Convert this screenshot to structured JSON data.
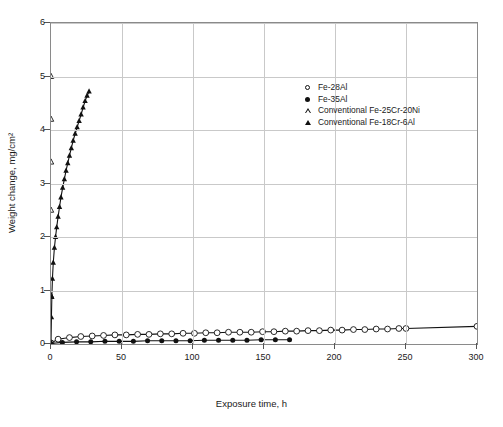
{
  "chart_data": {
    "type": "scatter",
    "title": "",
    "xlabel": "Exposure time, h",
    "ylabel": "Weight change, mg/cm²",
    "xlim": [
      0,
      300
    ],
    "ylim": [
      0,
      6
    ],
    "xticks": [
      0,
      50,
      100,
      150,
      200,
      250,
      300
    ],
    "yticks": [
      0,
      1,
      2,
      3,
      4,
      5,
      6
    ],
    "grid": true,
    "legend_position": "upper-center-right",
    "series": [
      {
        "name": "Fe-28Al",
        "marker": "circle-open",
        "line": true,
        "x": [
          0,
          5,
          13,
          21,
          29,
          37,
          45,
          53,
          61,
          69,
          77,
          85,
          93,
          101,
          109,
          117,
          125,
          133,
          141,
          149,
          157,
          165,
          173,
          181,
          189,
          197,
          205,
          213,
          221,
          229,
          237,
          245,
          250,
          300
        ],
        "y": [
          0.02,
          0.09,
          0.12,
          0.14,
          0.15,
          0.16,
          0.17,
          0.17,
          0.18,
          0.18,
          0.19,
          0.19,
          0.2,
          0.2,
          0.21,
          0.21,
          0.22,
          0.22,
          0.22,
          0.23,
          0.23,
          0.24,
          0.24,
          0.25,
          0.25,
          0.26,
          0.26,
          0.27,
          0.27,
          0.28,
          0.28,
          0.29,
          0.29,
          0.33
        ]
      },
      {
        "name": "Fe-35Al",
        "marker": "circle-fill",
        "line": true,
        "x": [
          0,
          8,
          18,
          28,
          38,
          48,
          58,
          68,
          78,
          88,
          98,
          108,
          118,
          128,
          138,
          148,
          158,
          168
        ],
        "y": [
          0.01,
          0.03,
          0.04,
          0.04,
          0.05,
          0.05,
          0.05,
          0.06,
          0.06,
          0.06,
          0.06,
          0.07,
          0.07,
          0.07,
          0.07,
          0.08,
          0.08,
          0.08
        ]
      },
      {
        "name": "Conventional Fe-25Cr-20Ni",
        "marker": "tri-open",
        "line": false,
        "x": [
          0,
          0,
          0,
          0,
          0
        ],
        "y": [
          0.9,
          2.5,
          3.4,
          4.2,
          5.0
        ]
      },
      {
        "name": "Conventional Fe-18Cr-6Al",
        "marker": "tri-fill",
        "line": true,
        "x": [
          0.0,
          0.3,
          0.6,
          1.0,
          1.6,
          2.4,
          3.2,
          4.0,
          5.0,
          6.0,
          7.0,
          8.2,
          9.4,
          10.6,
          11.8,
          13.0,
          14.3,
          15.6,
          17.0,
          18.4,
          19.8,
          21.2,
          22.6,
          24.0,
          25.4,
          26.8
        ],
        "y": [
          0.02,
          0.5,
          0.88,
          1.22,
          1.52,
          1.8,
          2.0,
          2.18,
          2.38,
          2.56,
          2.74,
          2.92,
          3.08,
          3.24,
          3.38,
          3.52,
          3.66,
          3.8,
          3.93,
          4.05,
          4.17,
          4.29,
          4.42,
          4.54,
          4.64,
          4.72
        ]
      }
    ]
  },
  "axes": {
    "x": {
      "label": "Exposure time, h",
      "tick_labels": [
        "0",
        "50",
        "100",
        "150",
        "200",
        "250",
        "300"
      ]
    },
    "y": {
      "label": "Weight change, mg/cm²",
      "tick_labels": [
        "0",
        "1",
        "2",
        "3",
        "4",
        "5",
        "6"
      ]
    }
  },
  "legend": {
    "entries": [
      {
        "label": "Fe-28Al",
        "marker": "circle-open"
      },
      {
        "label": "Fe-35Al",
        "marker": "circle-fill"
      },
      {
        "label": "Conventional Fe-25Cr-20Ni",
        "marker": "tri-open"
      },
      {
        "label": "Conventional Fe-18Cr-6Al",
        "marker": "tri-fill"
      }
    ]
  },
  "caption": {
    "text": ""
  },
  "colors": {
    "ink": "#111111",
    "frame": "#8a8a8a",
    "grid": "#c9c9c9",
    "background": "#ffffff"
  }
}
